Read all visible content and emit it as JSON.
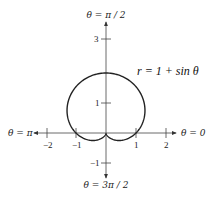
{
  "chart_data": {
    "type": "line",
    "subtype": "polar",
    "title": "",
    "equation_label": "r = 1 + sin θ",
    "function": "r = 1 + sin(theta)",
    "theta_range": [
      0,
      6.283185307
    ],
    "axes": {
      "x_ticks": [
        -2,
        -1,
        1,
        2
      ],
      "x_tick_labels": [
        "−2",
        "−1",
        "1",
        "2"
      ],
      "y_ticks": [
        3,
        1,
        -1
      ],
      "y_tick_labels": [
        "3",
        "1",
        "−1"
      ],
      "xlim": [
        -3,
        3
      ],
      "ylim": [
        -1.5,
        3.5
      ]
    },
    "direction_labels": {
      "right": "θ = 0",
      "top": "θ = π / 2",
      "left": "θ = π",
      "bottom": "θ = 3π / 2"
    },
    "grid": false,
    "legend": "none",
    "series": [
      {
        "name": "r = 1 + sin θ",
        "points_sample": [
          {
            "theta": "0",
            "r": 1
          },
          {
            "theta": "π/2",
            "r": 2
          },
          {
            "theta": "π",
            "r": 1
          },
          {
            "theta": "3π/2",
            "r": 0
          }
        ]
      }
    ]
  },
  "layout": {
    "origin_px": [
      106,
      133
    ],
    "unit_px": 30,
    "curve_color": "#222222",
    "axis_color": "#333333"
  }
}
